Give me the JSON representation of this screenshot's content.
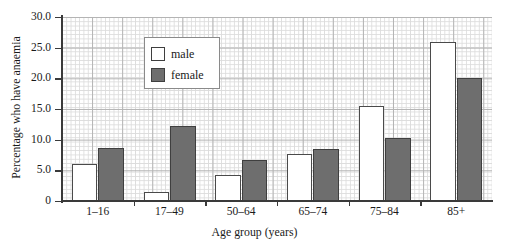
{
  "chart_data": {
    "type": "bar",
    "title": "",
    "xlabel": "Age group (years)",
    "ylabel": "Percentage who have anaemia",
    "categories": [
      "1–16",
      "17–49",
      "50–64",
      "65–74",
      "75–84",
      "85+"
    ],
    "series": [
      {
        "name": "male",
        "values": [
          6.0,
          1.5,
          4.3,
          7.7,
          15.5,
          26.0
        ],
        "color": "#ffffff"
      },
      {
        "name": "female",
        "values": [
          8.7,
          12.2,
          6.7,
          8.4,
          10.2,
          20.0
        ],
        "color": "#6e6e6e"
      }
    ],
    "ylim": [
      0,
      30
    ],
    "ytick_labels": [
      "0",
      "5.0",
      "10.0",
      "15.0",
      "20.0",
      "25.0",
      "30.0"
    ],
    "ytick_values": [
      0,
      5,
      10,
      15,
      20,
      25,
      30
    ],
    "grid": true,
    "legend_position": "top-left"
  },
  "legend": {
    "entries": [
      {
        "label": "male"
      },
      {
        "label": "female"
      }
    ]
  }
}
